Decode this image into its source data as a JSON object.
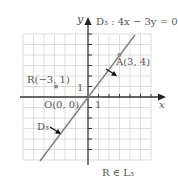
{
  "figure": {
    "axes": {
      "x_label": "x",
      "y_label": "y",
      "unit_x": "1",
      "unit_y": "1"
    },
    "line": {
      "name": "D₃",
      "equation": "D₃ : 4x − 3y = 0",
      "label": "D₃"
    },
    "points": [
      {
        "name": "A",
        "label": "A(3, 4)",
        "x": 3,
        "y": 4
      },
      {
        "name": "R",
        "label": "R(−3, 1)",
        "x": -3,
        "y": 1
      },
      {
        "name": "O",
        "label": "O(0, 0)",
        "x": 0,
        "y": 0
      }
    ],
    "caption": "R ∈ L₃",
    "colors": {
      "grid": "#d0d0d0",
      "axis": "#333333",
      "line": "#7a7a7a",
      "point": "#888888",
      "text": "#555555"
    }
  }
}
